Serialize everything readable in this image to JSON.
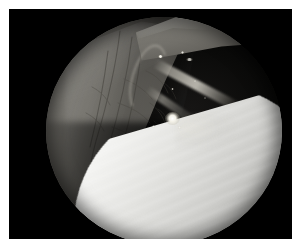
{
  "image": {
    "kind": "arthroscopic-endoscopic-photograph",
    "modality_label": "Arthroscopy",
    "caption": "Arthroscopic view of a joint: bright white articular cartilage of the femoral condyle fills the lower right, vascularised grey synovial soft tissue occupies the left, a pointed plica/meniscal fold projects from the upper right, and a slender probe crosses the dark cavity with a bright specular light reflection at centre.",
    "frame": {
      "background_color": "#000000",
      "border_color": "#ffffff",
      "width_px": 301,
      "height_px": 247
    },
    "field_of_view": {
      "shape": "circle",
      "center_x_px": 155,
      "center_y_px": 131,
      "diameter_px": 236,
      "letterbox_color": "#000000"
    },
    "regions": [
      {
        "name": "soft-tissue-mass",
        "description": "Grey vascularised synovial tissue, upper left to lower left",
        "color": "#6e6c66",
        "highlight_color": "#8a8881",
        "shadow_color": "#1b1b19"
      },
      {
        "name": "pointed-fold",
        "description": "Pointed fin-shaped plica / meniscal fold, upper right",
        "color": "#73716b",
        "highlight_color": "#8a8881"
      },
      {
        "name": "articular-cartilage",
        "description": "Bright white condylar cartilage surface with fine striations, lower right",
        "color": "#ffffff",
        "midtone_color": "#d2d2cf",
        "shadow_color": "#7d7d7a"
      },
      {
        "name": "joint-cavity",
        "description": "Dark unlit interior of the joint space, centre to right",
        "color": "#0a0a09"
      },
      {
        "name": "probe",
        "description": "Slender instrument / fibre crossing the dark cavity diagonally",
        "color": "#c4c1b8"
      }
    ],
    "specular_highlights": [
      {
        "name": "primary-light-reflection",
        "x_px": 162,
        "y_px": 108,
        "color": "#ffffff",
        "size_px": 15
      },
      {
        "name": "upper-glint-a",
        "x_px": 150,
        "y_px": 46,
        "color": "#ffffff",
        "size_px": 5
      },
      {
        "name": "upper-glint-b",
        "x_px": 173,
        "y_px": 42,
        "color": "#ffffff",
        "size_px": 4
      },
      {
        "name": "upper-glint-c",
        "x_px": 178,
        "y_px": 49,
        "color": "#f2f0e6",
        "size_px": 7
      },
      {
        "name": "mid-glint-d",
        "x_px": 166,
        "y_px": 78,
        "color": "#f2f0e6",
        "size_px": 3
      },
      {
        "name": "mid-glint-e",
        "x_px": 187,
        "y_px": 71,
        "color": "#f2f0e6",
        "size_px": 3
      },
      {
        "name": "lower-glint-f",
        "x_px": 143,
        "y_px": 122,
        "color": "#f2f0e6",
        "size_px": 3
      },
      {
        "name": "lower-glint-g",
        "x_px": 169,
        "y_px": 123,
        "color": "#f2f0e6",
        "size_px": 3
      },
      {
        "name": "right-glint-h",
        "x_px": 196,
        "y_px": 92,
        "color": "#f2f0e6",
        "size_px": 2
      }
    ]
  }
}
